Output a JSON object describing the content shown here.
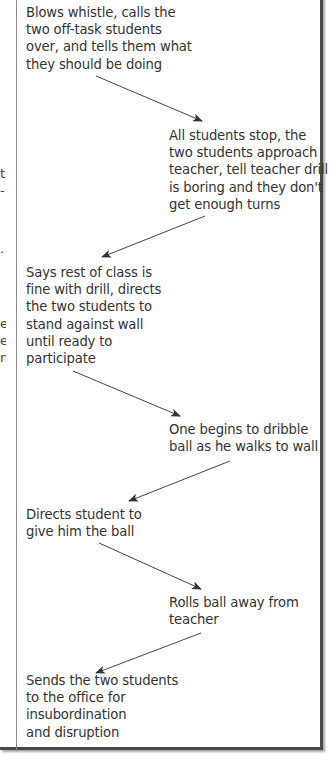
{
  "diagram": {
    "steps": [
      {
        "id": 1,
        "side": "teacher",
        "text": "Blows whistle, calls the two off-task students over, and tells them what they should be doing",
        "lines": [
          "Blows whistle, calls the",
          "two off-task students",
          "over, and tells them what",
          "they should be doing"
        ]
      },
      {
        "id": 2,
        "side": "students",
        "text": "All students stop, the two students approach teacher, tell teacher drill is boring and they don't get enough turns",
        "lines": [
          "All students stop, the",
          "two students approach",
          "teacher, tell teacher drill",
          "is boring and they don't",
          "get enough turns"
        ]
      },
      {
        "id": 3,
        "side": "teacher",
        "text": "Says rest of class is fine with drill, directs the two students to stand against wall until ready to participate",
        "lines": [
          "Says rest of class is",
          "fine with drill, directs",
          "the two students to",
          "stand against wall",
          "until ready to",
          "participate"
        ]
      },
      {
        "id": 4,
        "side": "students",
        "text": "One begins to dribble ball as he walks to wall",
        "lines": [
          "One begins to dribble",
          "ball as he walks to wall"
        ]
      },
      {
        "id": 5,
        "side": "teacher",
        "text": "Directs student to give him the ball",
        "lines": [
          "Directs student to",
          "give him the ball"
        ]
      },
      {
        "id": 6,
        "side": "students",
        "text": "Rolls ball away from teacher",
        "lines": [
          "Rolls ball away from",
          "teacher"
        ]
      },
      {
        "id": 7,
        "side": "teacher",
        "text": "Sends the two students to the office for insubordination and disruption",
        "lines": [
          "Sends the two students",
          "to the office for",
          "insubordination",
          "and disruption"
        ]
      }
    ],
    "left_column_fragments": [
      {
        "text": "t",
        "top": 165
      },
      {
        "text": "-",
        "top": 182
      },
      {
        "text": ".",
        "top": 240
      },
      {
        "text": "e",
        "top": 315
      },
      {
        "text": "e",
        "top": 332
      },
      {
        "text": "n",
        "top": 349
      }
    ],
    "colors": {
      "border": "#4a4a4a",
      "divider": "#8a8a8a",
      "text": "#333333",
      "arrow": "#333333"
    }
  }
}
